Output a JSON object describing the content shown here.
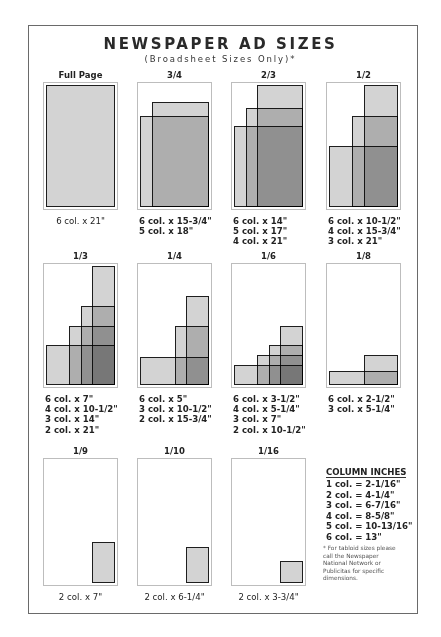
{
  "header": {
    "title": "NEWSPAPER AD SIZES",
    "subtitle": "(Broadsheet Sizes Only)*"
  },
  "diagram": {
    "total_columns": 6,
    "total_inches": 21,
    "colors": {
      "frame": "#6a6a6a",
      "panel_border": "#bdbdbd",
      "ad_fill": "#d4d4d4",
      "ad_overlap_mid": "#9a9a9a",
      "ad_overlap_dark": "#6e6e6e",
      "ad_border": "#1e1e1e"
    },
    "panels": [
      {
        "label": "Full Page",
        "x": 43,
        "y": 82,
        "h": 128,
        "ads": [
          {
            "cols": 6,
            "inches": 21
          }
        ],
        "sizes": [
          "6 col. x 21\""
        ]
      },
      {
        "label": "3/4",
        "x": 137,
        "y": 82,
        "h": 128,
        "ads": [
          {
            "cols": 6,
            "inches": 15.75
          },
          {
            "cols": 5,
            "inches": 18
          }
        ],
        "sizes": [
          "6 col. x 15-3/4\"",
          "5 col. x 18\""
        ]
      },
      {
        "label": "2/3",
        "x": 231,
        "y": 82,
        "h": 128,
        "ads": [
          {
            "cols": 6,
            "inches": 14
          },
          {
            "cols": 5,
            "inches": 17
          },
          {
            "cols": 4,
            "inches": 21
          }
        ],
        "sizes": [
          "6 col. x 14\"",
          "5 col. x 17\"",
          "4 col. x 21\""
        ]
      },
      {
        "label": "1/2",
        "x": 326,
        "y": 82,
        "h": 128,
        "ads": [
          {
            "cols": 6,
            "inches": 10.5
          },
          {
            "cols": 4,
            "inches": 15.75
          },
          {
            "cols": 3,
            "inches": 21
          }
        ],
        "sizes": [
          "6 col. x 10-1/2\"",
          "4 col. x 15-3/4\"",
          "3 col. x 21\""
        ]
      },
      {
        "label": "1/3",
        "x": 43,
        "y": 263,
        "h": 125,
        "ads": [
          {
            "cols": 6,
            "inches": 7
          },
          {
            "cols": 4,
            "inches": 10.5
          },
          {
            "cols": 3,
            "inches": 14
          },
          {
            "cols": 2,
            "inches": 21
          }
        ],
        "sizes": [
          "6 col. x 7\"",
          "4 col. x 10-1/2\"",
          "3 col. x 14\"",
          "2 col. x 21\""
        ]
      },
      {
        "label": "1/4",
        "x": 137,
        "y": 263,
        "h": 125,
        "ads": [
          {
            "cols": 6,
            "inches": 5
          },
          {
            "cols": 3,
            "inches": 10.5
          },
          {
            "cols": 2,
            "inches": 15.75
          }
        ],
        "sizes": [
          "6 col. x 5\"",
          "3 col. x 10-1/2\"",
          "2 col. x 15-3/4\""
        ]
      },
      {
        "label": "1/6",
        "x": 231,
        "y": 263,
        "h": 125,
        "ads": [
          {
            "cols": 6,
            "inches": 3.5
          },
          {
            "cols": 4,
            "inches": 5.25
          },
          {
            "cols": 3,
            "inches": 7
          },
          {
            "cols": 2,
            "inches": 10.5
          }
        ],
        "sizes": [
          "6 col. x 3-1/2\"",
          "4 col. x 5-1/4\"",
          "3 col. x 7\"",
          "2 col. x 10-1/2\""
        ]
      },
      {
        "label": "1/8",
        "x": 326,
        "y": 263,
        "h": 125,
        "ads": [
          {
            "cols": 6,
            "inches": 2.5
          },
          {
            "cols": 3,
            "inches": 5.25
          }
        ],
        "sizes": [
          "6 col. x 2-1/2\"",
          "3 col. x 5-1/4\""
        ]
      },
      {
        "label": "1/9",
        "x": 43,
        "y": 458,
        "h": 128,
        "ads": [
          {
            "cols": 2,
            "inches": 7
          }
        ],
        "sizes": [
          "2 col. x 7\""
        ]
      },
      {
        "label": "1/10",
        "x": 137,
        "y": 458,
        "h": 128,
        "ads": [
          {
            "cols": 2,
            "inches": 6.25
          }
        ],
        "sizes": [
          "2 col. x 6-1/4\""
        ]
      },
      {
        "label": "1/16",
        "x": 231,
        "y": 458,
        "h": 128,
        "ads": [
          {
            "cols": 2,
            "inches": 3.75
          }
        ],
        "sizes": [
          "2 col. x 3-3/4\""
        ]
      }
    ]
  },
  "column_inches": {
    "heading": "COLUMN INCHES",
    "rows": [
      "1 col. = 2-1/16\"",
      "2 col. = 4-1/4\"",
      "3 col. = 6-7/16\"",
      "4 col. = 8-5/8\"",
      "5 col. = 10-13/16\"",
      "6 col. = 13\""
    ]
  },
  "footnote": "* For tabloid sizes please call the Newspaper National Network or Publicitas for specific dimensions."
}
